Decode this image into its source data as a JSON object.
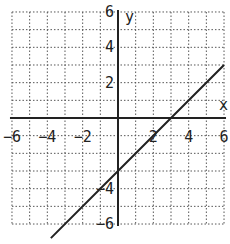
{
  "chart_data": {
    "type": "line",
    "title": "",
    "xlabel": "x",
    "ylabel": "y",
    "xlim": [
      -6,
      6
    ],
    "ylim": [
      -6,
      6
    ],
    "grid": true,
    "grid_style": "dotted",
    "x_ticks": [
      -6,
      -4,
      -2,
      2,
      4,
      6
    ],
    "y_ticks": [
      6,
      4,
      2,
      -4,
      -6
    ],
    "x_tick_labels": [
      "-6",
      "-4",
      "-2",
      "2",
      "4",
      "6"
    ],
    "y_tick_labels": [
      "6",
      "4",
      "2",
      "-4",
      "-6"
    ],
    "series": [
      {
        "name": "y = x - 3",
        "x": [
          -3.8,
          0,
          3,
          6
        ],
        "y": [
          -6.8,
          -3,
          0,
          3
        ],
        "color": "#222222"
      }
    ]
  },
  "axis_labels": {
    "x": "x",
    "y": "y"
  },
  "colors": {
    "grid": "#555555",
    "axis": "#222222",
    "line": "#222222"
  }
}
